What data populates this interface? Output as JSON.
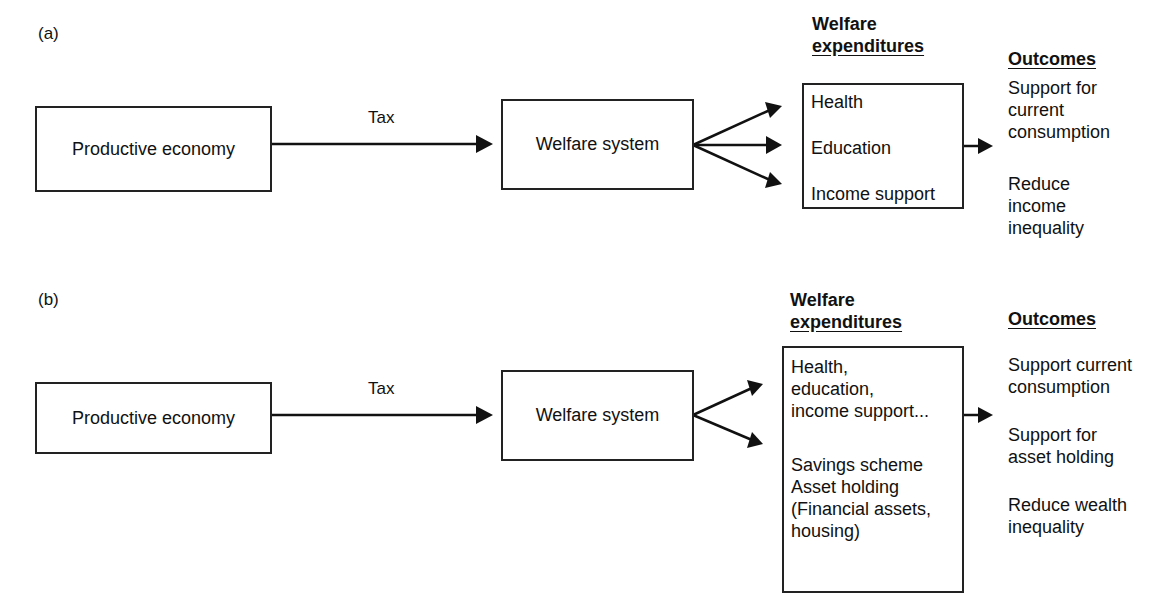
{
  "panel_a": {
    "label": "(a)",
    "source_box": "Productive economy",
    "flow_label": "Tax",
    "system_box": "Welfare system",
    "expenditures": {
      "heading_line1": "Welfare",
      "heading_line2": "expenditures",
      "items": [
        "Health",
        "Education",
        "Income support"
      ]
    },
    "outcomes": {
      "heading": "Outcomes",
      "items": [
        [
          "Support for",
          "current",
          "consumption"
        ],
        [
          "Reduce",
          "income",
          "inequality"
        ]
      ]
    }
  },
  "panel_b": {
    "label": "(b)",
    "source_box": "Productive economy",
    "flow_label": "Tax",
    "system_box": "Welfare system",
    "expenditures": {
      "heading_line1": "Welfare",
      "heading_line2": "expenditures",
      "group1": [
        "Health,",
        "education,",
        "income support..."
      ],
      "group2": [
        "Savings scheme",
        "Asset holding",
        "(Financial assets,",
        "housing)"
      ]
    },
    "outcomes": {
      "heading": "Outcomes",
      "items": [
        [
          "Support current",
          "consumption"
        ],
        [
          "Support for",
          "asset holding"
        ],
        [
          "Reduce wealth",
          "inequality"
        ]
      ]
    }
  },
  "colors": {
    "line": "#111111",
    "background": "#ffffff"
  }
}
